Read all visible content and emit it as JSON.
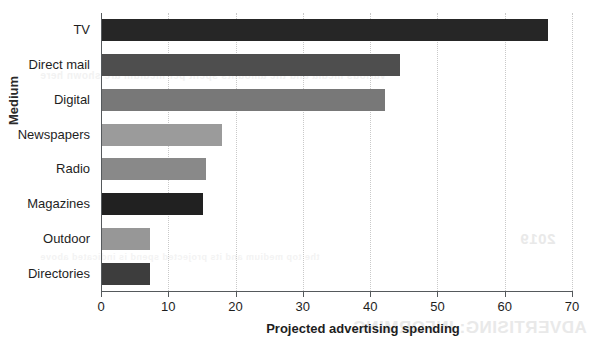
{
  "chart_data": {
    "type": "bar",
    "orientation": "horizontal",
    "title": "",
    "xlabel": "Projected advertising spending",
    "ylabel": "Medium",
    "categories": [
      "TV",
      "Direct mail",
      "Digital",
      "Newspapers",
      "Radio",
      "Magazines",
      "Outdoor",
      "Directories"
    ],
    "values": [
      66.5,
      44.5,
      42.2,
      18.0,
      15.6,
      15.2,
      7.3,
      7.3
    ],
    "xlim": [
      0,
      70
    ],
    "ylim": null,
    "xticks": [
      0,
      10,
      20,
      30,
      40,
      50,
      60,
      70
    ],
    "xticklabels": [
      "0",
      "10",
      "20",
      "30",
      "40",
      "50",
      "60",
      "70"
    ],
    "grid": "vertical-dotted",
    "legend": null,
    "bar_colors": [
      "#262626",
      "#4e4e4e",
      "#787878",
      "#9b9b9b",
      "#898989",
      "#212121",
      "#979797",
      "#3d3d3d"
    ]
  },
  "decor": {
    "bleed_1": "ADVERTISING: INFORMING",
    "bleed_2": "2019",
    "bleed_3": "various media and the amounts spent per medium are shown here",
    "bleed_4": "the top medium and its projected spend is indicated above"
  }
}
